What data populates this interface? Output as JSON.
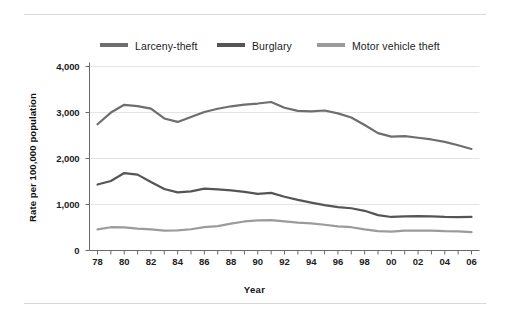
{
  "chart_data": {
    "type": "line",
    "title": "",
    "xlabel": "Year",
    "ylabel": "Rate per 100,000 population",
    "xlim": [
      1977.4,
      2006.6
    ],
    "ylim": [
      0,
      4000
    ],
    "grid": true,
    "legend_position": "top",
    "x": [
      1978,
      1979,
      1980,
      1981,
      1982,
      1983,
      1984,
      1985,
      1986,
      1987,
      1988,
      1989,
      1990,
      1991,
      1992,
      1993,
      1994,
      1995,
      1996,
      1997,
      1998,
      1999,
      2000,
      2001,
      2002,
      2003,
      2004,
      2005,
      2006
    ],
    "xtick_labels": [
      "78",
      "80",
      "82",
      "84",
      "86",
      "88",
      "90",
      "92",
      "94",
      "96",
      "98",
      "00",
      "02",
      "04",
      "06"
    ],
    "xtick_values": [
      1978,
      1980,
      1982,
      1984,
      1986,
      1988,
      1990,
      1992,
      1994,
      1996,
      1998,
      2000,
      2002,
      2004,
      2006
    ],
    "ytick_labels": [
      "0",
      "1,000",
      "2,000",
      "3,000",
      "4,000"
    ],
    "ytick_values": [
      0,
      1000,
      2000,
      3000,
      4000
    ],
    "series": [
      {
        "name": "Larceny-theft",
        "color": "#6e6e6e",
        "values": [
          2745,
          2999,
          3167,
          3140,
          3085,
          2870,
          2795,
          2901,
          3010,
          3081,
          3135,
          3171,
          3195,
          3229,
          3103,
          3034,
          3026,
          3043,
          2980,
          2891,
          2729,
          2551,
          2477,
          2485,
          2451,
          2414,
          2362,
          2287,
          2207
        ]
      },
      {
        "name": "Burglary",
        "color": "#555555",
        "values": [
          1434,
          1512,
          1684,
          1650,
          1489,
          1338,
          1264,
          1287,
          1345,
          1330,
          1309,
          1276,
          1232,
          1252,
          1168,
          1100,
          1042,
          987,
          943,
          919,
          863,
          770,
          729,
          741,
          747,
          741,
          730,
          726,
          729
        ]
      },
      {
        "name": "Motor vehicle theft",
        "color": "#9b9b9b",
        "values": [
          459,
          506,
          502,
          475,
          459,
          431,
          437,
          462,
          508,
          529,
          583,
          631,
          657,
          659,
          632,
          606,
          591,
          560,
          526,
          506,
          459,
          422,
          412,
          431,
          433,
          433,
          421,
          417,
          398
        ]
      }
    ]
  },
  "axis": {
    "ylabel": "Rate per 100,000 population",
    "xlabel": "Year"
  },
  "legend": {
    "items": [
      {
        "label": "Larceny-theft",
        "color": "#6e6e6e"
      },
      {
        "label": "Burglary",
        "color": "#555555"
      },
      {
        "label": "Motor vehicle theft",
        "color": "#9b9b9b"
      }
    ]
  }
}
